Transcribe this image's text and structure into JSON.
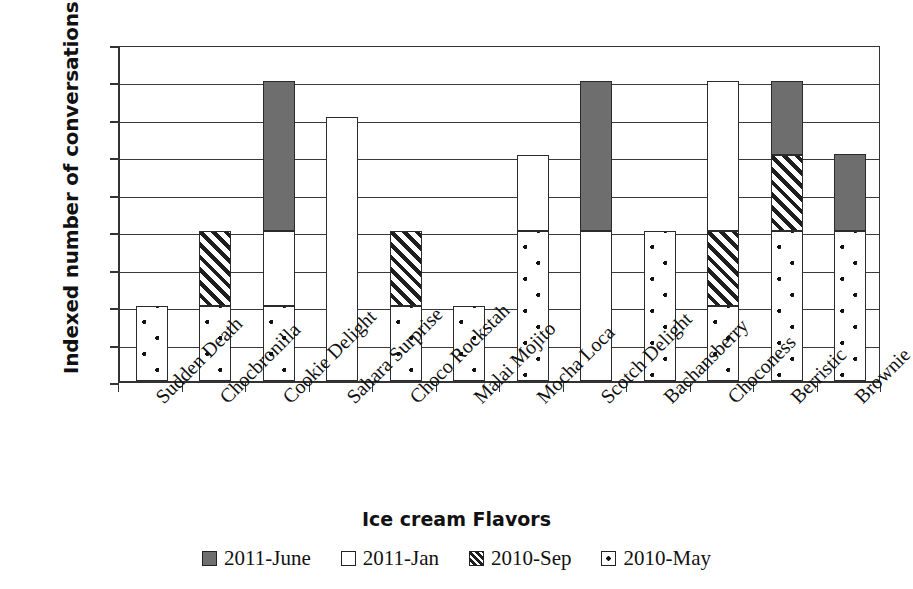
{
  "chart_data": {
    "type": "bar",
    "subtype": "stacked-bar",
    "title": "",
    "xlabel": "Ice cream Flavors",
    "ylabel": "Indexed number of conversations",
    "ylim": [
      0,
      450
    ],
    "ytick_step": 50,
    "yticks": [
      0,
      50,
      100,
      150,
      200,
      250,
      300,
      350,
      400,
      450
    ],
    "grid": "horizontal",
    "legend_position": "bottom",
    "categories": [
      "Sudden Death",
      "Chocbronilla",
      "Cookie Delight",
      "Sahara Surprise",
      "Choco Rockstah",
      "Malai Mojito",
      "Mocha Loca",
      "Scotch Delight",
      "Bachansberry",
      "Choconess",
      "Berristic",
      "Brownie"
    ],
    "series": [
      {
        "name": "2010-May",
        "fill": "dotted",
        "color": "#ffffff",
        "values": [
          100,
          100,
          100,
          0,
          100,
          100,
          200,
          0,
          200,
          100,
          200,
          200
        ]
      },
      {
        "name": "2010-Sep",
        "fill": "hatched",
        "color": "#ffffff",
        "values": [
          0,
          100,
          0,
          0,
          100,
          0,
          0,
          0,
          0,
          100,
          102,
          0
        ]
      },
      {
        "name": "2011-Jan",
        "fill": "solid",
        "color": "#ffffff",
        "values": [
          0,
          0,
          100,
          352,
          0,
          0,
          102,
          200,
          0,
          200,
          0,
          0
        ]
      },
      {
        "name": "2011-June",
        "fill": "solid",
        "color": "#6e6e6e",
        "values": [
          0,
          0,
          200,
          0,
          0,
          0,
          0,
          200,
          0,
          0,
          98,
          103
        ]
      }
    ],
    "totals": [
      100,
      200,
      400,
      352,
      200,
      100,
      302,
      400,
      200,
      400,
      400,
      303
    ],
    "legend": [
      {
        "label": "2011-June",
        "fill": "solid",
        "color": "#6e6e6e"
      },
      {
        "label": "2011-Jan",
        "fill": "solid",
        "color": "#ffffff"
      },
      {
        "label": "2010-Sep",
        "fill": "hatched",
        "color": "#ffffff"
      },
      {
        "label": "2010-May",
        "fill": "dotted",
        "color": "#ffffff"
      }
    ]
  }
}
